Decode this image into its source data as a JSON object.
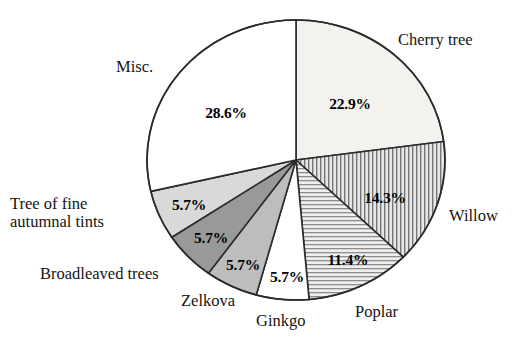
{
  "chart_data": {
    "type": "pie",
    "title": "",
    "subtitle": "",
    "xlabel": "",
    "ylabel": "",
    "legend_position": "outside-labels",
    "grid": false,
    "start_angle_deg": 0,
    "direction": "clockwise",
    "units": "percent",
    "categories": [
      "Cherry tree",
      "Willow",
      "Poplar",
      "Ginkgo",
      "Zelkova",
      "Broadleaved trees",
      "Tree of fine autumnal tints",
      "Misc."
    ],
    "values": [
      22.9,
      14.3,
      11.4,
      5.7,
      5.7,
      5.7,
      5.7,
      28.6
    ],
    "value_labels": [
      "22.9%",
      "14.3%",
      "11.4%",
      "5.7%",
      "5.7%",
      "5.7%",
      "5.7%",
      "28.6%"
    ],
    "slices": [
      {
        "name": "Cherry tree",
        "value": 22.9,
        "value_label": "22.9%",
        "fill": "#f4f2ef",
        "pattern": "solid",
        "label_x": 350,
        "label_y": 104,
        "cat_x": 398,
        "cat_y": 32
      },
      {
        "name": "Willow",
        "value": 14.3,
        "value_label": "14.3%",
        "fill": "#d5d5d5",
        "pattern": "vertical-lines",
        "label_x": 385,
        "label_y": 198,
        "cat_x": 449,
        "cat_y": 208
      },
      {
        "name": "Poplar",
        "value": 11.4,
        "value_label": "11.4%",
        "fill": "#e3e3e3",
        "pattern": "horizontal-lines",
        "label_x": 348,
        "label_y": 260,
        "cat_x": 355,
        "cat_y": 303
      },
      {
        "name": "Ginkgo",
        "value": 5.7,
        "value_label": "5.7%",
        "fill": "#ffffff",
        "pattern": "solid",
        "label_x": 287,
        "label_y": 276,
        "cat_x": 256,
        "cat_y": 312
      },
      {
        "name": "Zelkova",
        "value": 5.7,
        "value_label": "5.7%",
        "fill": "#bdbdbd",
        "pattern": "solid",
        "label_x": 243,
        "label_y": 265,
        "cat_x": 182,
        "cat_y": 293
      },
      {
        "name": "Broadleaved trees",
        "value": 5.7,
        "value_label": "5.7%",
        "fill": "#999999",
        "pattern": "solid",
        "label_x": 210,
        "label_y": 238,
        "cat_x": 40,
        "cat_y": 266
      },
      {
        "name": "Tree of fine autumnal tints",
        "value": 5.7,
        "value_label": "5.7%",
        "fill": "#d9d9d9",
        "pattern": "solid",
        "label_x": 188,
        "label_y": 205,
        "cat_x": 10,
        "cat_y": 196
      },
      {
        "name": "Misc.",
        "value": 28.6,
        "value_label": "28.6%",
        "fill": "#ffffff",
        "pattern": "solid",
        "label_x": 226,
        "label_y": 113,
        "cat_x": 117,
        "cat_y": 59
      }
    ],
    "geometry": {
      "center_x": 296,
      "center_y": 160,
      "radius_x": 149,
      "radius_y": 140,
      "stroke": "#2b2b2b",
      "stroke_width": 1.6
    }
  },
  "labels": {
    "cherry_tree": "Cherry tree",
    "willow": "Willow",
    "poplar": "Poplar",
    "ginkgo": "Ginkgo",
    "zelkova": "Zelkova",
    "broadleaved_trees": "Broadleaved trees",
    "tree_of_fine_autumnal_tints_line1": "Tree of fine",
    "tree_of_fine_autumnal_tints_line2": "autumnal tints",
    "misc": "Misc."
  },
  "percent_labels": {
    "cherry_tree": "22.9%",
    "willow": "14.3%",
    "poplar": "11.4%",
    "ginkgo": "5.7%",
    "zelkova": "5.7%",
    "broadleaved_trees": "5.7%",
    "tree_of_fine_autumnal_tints": "5.7%",
    "misc": "28.6%"
  }
}
